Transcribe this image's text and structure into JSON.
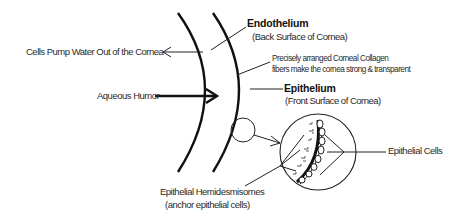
{
  "diagram": {
    "labels": {
      "cells_pump": "Cells Pump Water Out of the Cornea",
      "aqueous_humor": "Aqueous Humor",
      "endothelium": "Endothelium",
      "endothelium_sub": "(Back Surface of Cornea)",
      "collagen_line1": "Precisely arranged Corneal Collagen",
      "collagen_line2": "fibers make the cornea strong & transparent",
      "epithelium": "Epithelium",
      "epithelium_sub": "(Front Surface of Cornea)",
      "epithelial_cells": "Epithelial Cells",
      "hemidesmosomes": "Epithelial Hemidesmisomes",
      "hemidesmosomes_sub": "(anchor epithelial cells)"
    },
    "nodes": [
      {
        "id": "endothelium-surface",
        "shape": "arc"
      },
      {
        "id": "epithelium-surface",
        "shape": "arc"
      },
      {
        "id": "detail-source-circle",
        "shape": "circle"
      },
      {
        "id": "magnified-detail-circle",
        "shape": "circle"
      }
    ],
    "edges": [
      {
        "from": "endothelium-surface",
        "to": "cells_pump",
        "type": "arrow"
      },
      {
        "from": "aqueous_humor",
        "to": "endothelium-surface",
        "type": "thick-arrow"
      },
      {
        "from": "detail-source-circle",
        "to": "magnified-detail-circle",
        "type": "arrow"
      }
    ],
    "colors": {
      "stroke": "#111111",
      "text": "#2a2a2a",
      "background": "#ffffff"
    }
  }
}
